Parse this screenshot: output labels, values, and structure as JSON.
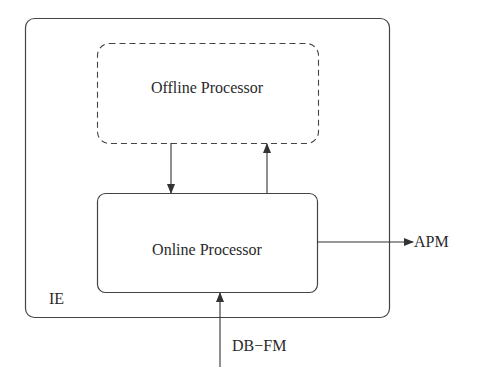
{
  "diagram": {
    "container": {
      "label": "IE"
    },
    "nodes": [
      {
        "id": "offline",
        "label": "Offline Processor",
        "style": "dashed"
      },
      {
        "id": "online",
        "label": "Online Processor",
        "style": "solid"
      }
    ],
    "edges": [
      {
        "from": "offline",
        "to": "online"
      },
      {
        "from": "online",
        "to": "offline"
      },
      {
        "from": "online",
        "to": "APM",
        "label": "APM"
      },
      {
        "from": "DB-FM",
        "to": "online",
        "label": "DB−FM"
      }
    ],
    "external": {
      "output_label": "APM",
      "input_label": "DB−FM"
    },
    "colors": {
      "stroke": "#333333",
      "background": "#ffffff"
    }
  }
}
